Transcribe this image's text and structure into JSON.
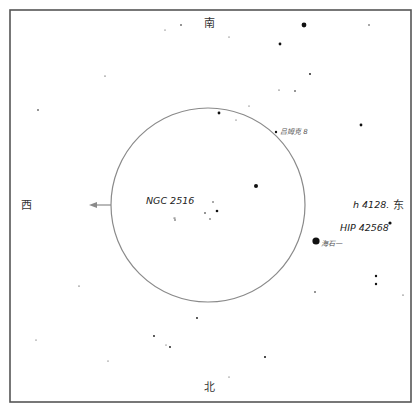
{
  "map": {
    "width": 419,
    "height": 409,
    "frame": {
      "x": 10,
      "y": 10,
      "w": 401,
      "h": 392,
      "color": "#555555"
    },
    "field_of_view": {
      "cx": 208,
      "cy": 205,
      "r": 97,
      "color": "#8a8a8a"
    },
    "direction_arrow": {
      "from": [
        111,
        205
      ],
      "to": [
        89,
        205
      ],
      "color": "#8a8a8a"
    },
    "directions": {
      "south": {
        "label": "南",
        "x": 209,
        "y": 27
      },
      "north": {
        "label": "北",
        "x": 209,
        "y": 391
      },
      "west": {
        "label": "西",
        "x": 26,
        "y": 209
      },
      "east": {
        "label": "东",
        "x": 398,
        "y": 209
      }
    },
    "labels": [
      {
        "id": "ngc2516",
        "text": "NGC 2516",
        "x": 146,
        "y": 204,
        "size": "lg"
      },
      {
        "id": "h4128",
        "text": "h 4128.",
        "x": 353,
        "y": 208,
        "size": "lg"
      },
      {
        "id": "hip42568",
        "text": "HIP 42568",
        "x": 340,
        "y": 231,
        "size": "lg"
      },
      {
        "id": "haishiyi",
        "text": "海石一",
        "x": 321,
        "y": 246,
        "size": "sm"
      },
      {
        "id": "lvkeke-b",
        "text": "吕姆克 8",
        "x": 280,
        "y": 134,
        "size": "sm"
      }
    ],
    "stars": [
      {
        "x": 304,
        "y": 25,
        "r": 2.4
      },
      {
        "x": 369,
        "y": 25,
        "r": 0.7
      },
      {
        "x": 181,
        "y": 25,
        "r": 0.8
      },
      {
        "x": 165,
        "y": 30,
        "r": 0.5
      },
      {
        "x": 280,
        "y": 44,
        "r": 1.4
      },
      {
        "x": 310,
        "y": 74,
        "r": 0.9
      },
      {
        "x": 279,
        "y": 90,
        "r": 0.6
      },
      {
        "x": 295,
        "y": 91,
        "r": 0.8
      },
      {
        "x": 105,
        "y": 76,
        "r": 0.6
      },
      {
        "x": 38,
        "y": 110,
        "r": 0.8
      },
      {
        "x": 219,
        "y": 113,
        "r": 1.4
      },
      {
        "x": 249,
        "y": 106,
        "r": 0.5
      },
      {
        "x": 236,
        "y": 120,
        "r": 0.5
      },
      {
        "x": 276,
        "y": 132,
        "r": 1.2
      },
      {
        "x": 361,
        "y": 125,
        "r": 1.4
      },
      {
        "x": 256,
        "y": 186,
        "r": 2.0
      },
      {
        "x": 217,
        "y": 211,
        "r": 1.3
      },
      {
        "x": 213,
        "y": 202,
        "r": 0.7
      },
      {
        "x": 205,
        "y": 213,
        "r": 0.8
      },
      {
        "x": 210,
        "y": 219,
        "r": 0.7
      },
      {
        "x": 175,
        "y": 220,
        "r": 0.7
      },
      {
        "x": 390,
        "y": 223,
        "r": 1.6
      },
      {
        "x": 316,
        "y": 241,
        "r": 3.6
      },
      {
        "x": 175,
        "y": 218,
        "r": 0.5
      },
      {
        "x": 376,
        "y": 276,
        "r": 1.2
      },
      {
        "x": 376,
        "y": 284,
        "r": 1.2
      },
      {
        "x": 315,
        "y": 292,
        "r": 0.8
      },
      {
        "x": 174,
        "y": 218,
        "r": 0.5
      },
      {
        "x": 79,
        "y": 286,
        "r": 0.6
      },
      {
        "x": 197,
        "y": 318,
        "r": 0.9
      },
      {
        "x": 154,
        "y": 336,
        "r": 0.9
      },
      {
        "x": 170,
        "y": 347,
        "r": 0.9
      },
      {
        "x": 166,
        "y": 345,
        "r": 0.5
      },
      {
        "x": 108,
        "y": 361,
        "r": 0.5
      },
      {
        "x": 265,
        "y": 357,
        "r": 1.0
      },
      {
        "x": 36,
        "y": 340,
        "r": 0.5
      },
      {
        "x": 229,
        "y": 377,
        "r": 0.5
      },
      {
        "x": 403,
        "y": 295,
        "r": 0.6
      },
      {
        "x": 229,
        "y": 37,
        "r": 0.5
      }
    ]
  }
}
